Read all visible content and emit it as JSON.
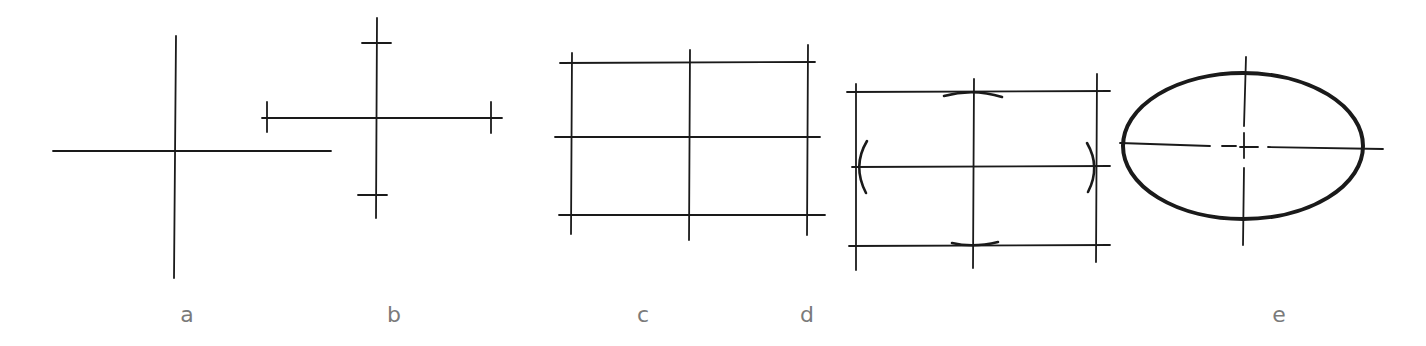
{
  "diagram": {
    "colors": {
      "stroke": "#1a1a1a",
      "label": "#7a7a7a",
      "background": "#ffffff"
    },
    "panels": [
      {
        "id": "a",
        "label": "a",
        "content": "two crossing axes"
      },
      {
        "id": "b",
        "label": "b",
        "content": "axes with end tick marks"
      },
      {
        "id": "c",
        "label": "c",
        "content": "bounding rectangle grid"
      },
      {
        "id": "d",
        "label": "d",
        "content": "grid with short arcs at axis endpoints"
      },
      {
        "id": "e",
        "label": "e",
        "content": "finished ellipse with center lines"
      }
    ]
  }
}
